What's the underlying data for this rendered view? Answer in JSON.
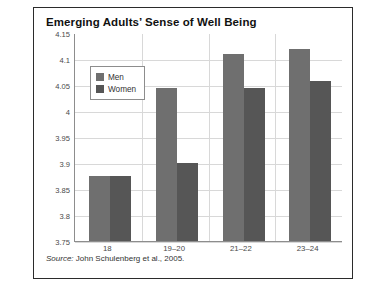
{
  "figure": {
    "title": "Emerging Adults’ Sense of Well Being",
    "source_word": "Source:",
    "source_text": " John Schulenberg et al., 2005."
  },
  "legend": {
    "position": "top-left-inside",
    "entries": [
      {
        "label": "Men",
        "color": "#6f6f6f"
      },
      {
        "label": "Women",
        "color": "#565656"
      }
    ]
  },
  "chart_data": {
    "type": "bar",
    "title": "Emerging Adults’ Sense of Well Being",
    "xlabel": "",
    "ylabel": "",
    "ylim": [
      3.75,
      4.15
    ],
    "ytick_step": 0.05,
    "yticks": [
      "4.15",
      "4.1",
      "4.05",
      "4",
      "3.95",
      "3.9",
      "3.85",
      "3.8",
      "3.75"
    ],
    "ytick_values": [
      4.15,
      4.1,
      4.05,
      4.0,
      3.95,
      3.9,
      3.85,
      3.8,
      3.75
    ],
    "grid": true,
    "categories": [
      "18",
      "19–20",
      "21–22",
      "23–24"
    ],
    "series": [
      {
        "name": "Men",
        "color": "#6f6f6f",
        "values": [
          3.875,
          4.045,
          4.11,
          4.12
        ]
      },
      {
        "name": "Women",
        "color": "#565656",
        "values": [
          3.875,
          3.9,
          4.045,
          4.058
        ]
      }
    ]
  }
}
